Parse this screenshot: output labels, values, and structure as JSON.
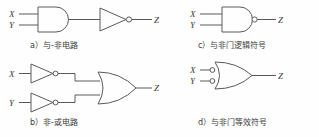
{
  "figure": {
    "background_color": "#fefefe",
    "line_color": "#5a5a5a",
    "text_color": "#3a3a3a"
  },
  "panels": [
    {
      "id": "a",
      "caption": "a）与-非电路",
      "inputs": [
        "X",
        "Y"
      ],
      "output": "Z",
      "gates": [
        "and-gate",
        "inverter-gate"
      ]
    },
    {
      "id": "b",
      "caption": "b）非-或电路",
      "inputs": [
        "X",
        "Y"
      ],
      "output": "Z",
      "gates": [
        "inverter-gate",
        "inverter-gate",
        "or-gate"
      ]
    },
    {
      "id": "c",
      "caption": "c）与非门逻辑符号",
      "inputs": [
        "X",
        "Y"
      ],
      "output": "Z",
      "gates": [
        "nand-gate"
      ]
    },
    {
      "id": "d",
      "caption": "d）与非门等效符号",
      "inputs": [
        "X",
        "Y"
      ],
      "output": "Z",
      "gates": [
        "or-gate-with-inverted-inputs"
      ]
    }
  ]
}
